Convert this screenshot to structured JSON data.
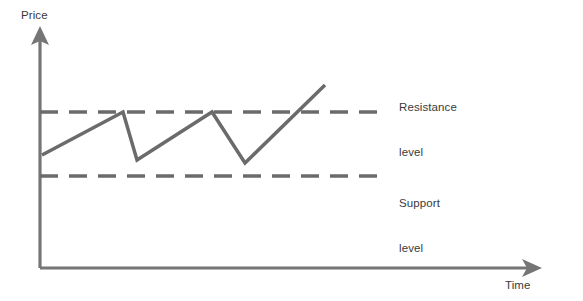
{
  "figure": {
    "title": "",
    "background_color": "#ffffff",
    "line_color": "#6b6b6b",
    "axis_color": "#757575",
    "text_color": "#3a3a3a"
  },
  "axes": {
    "y_label": "Price",
    "x_label": "Time",
    "y_arrow_icon": "arrow-up-icon",
    "x_arrow_icon": "arrow-right-icon"
  },
  "annotations": {
    "resistance": {
      "line1": "Resistance",
      "line2": "level"
    },
    "support": {
      "line1": "Support",
      "line2": "level"
    }
  },
  "chart_data": {
    "type": "line",
    "xlabel": "Time",
    "ylabel": "Price",
    "xlim": [
      0,
      100
    ],
    "ylim": [
      0,
      100
    ],
    "grid": false,
    "legend_position": "right",
    "axis_ticks": {
      "x": [],
      "y": []
    },
    "series": [
      {
        "name": "Price",
        "style": "solid",
        "color": "#6b6b6b",
        "width": 3.5,
        "points_px": [
          [
            42,
            155
          ],
          [
            123,
            112
          ],
          [
            137,
            160
          ],
          [
            212,
            112
          ],
          [
            245,
            163
          ],
          [
            325,
            85
          ]
        ],
        "points": [
          [
            0.0,
            51.0
          ],
          [
            28.6,
            71.3
          ],
          [
            33.6,
            48.6
          ],
          [
            60.1,
            71.3
          ],
          [
            71.7,
            47.2
          ],
          [
            100.0,
            84.0
          ]
        ],
        "description": "Zigzag price path: rises to resistance, pulls back, retests resistance, pulls back, then breaks out above resistance"
      }
    ],
    "reference_lines": [
      {
        "name": "Resistance level",
        "orientation": "horizontal",
        "y_px": 112,
        "y_value": 71.3,
        "x_start_px": 40,
        "x_end_px": 387,
        "style": "dashed",
        "color": "#6b6b6b",
        "width": 3.5,
        "dash_px": [
          18,
          11
        ]
      },
      {
        "name": "Support level",
        "orientation": "horizontal",
        "y_px": 176,
        "y_value": 41.2,
        "x_start_px": 40,
        "x_end_px": 387,
        "style": "dashed",
        "color": "#6b6b6b",
        "width": 3.5,
        "dash_px": [
          18,
          11
        ]
      }
    ],
    "axis_geometry": {
      "origin_px": [
        40,
        268
      ],
      "y_axis_top_px": [
        40,
        32
      ],
      "x_axis_right_px": [
        540,
        268
      ]
    }
  }
}
